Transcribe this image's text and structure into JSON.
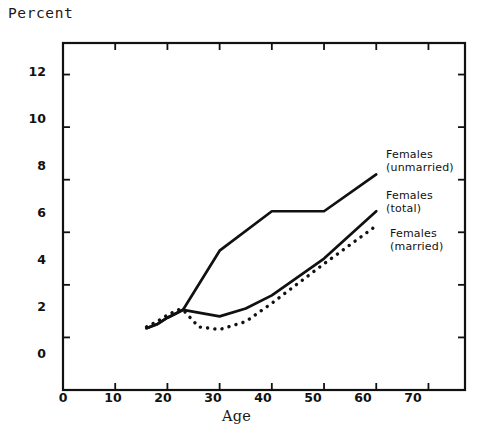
{
  "figure": {
    "y_axis_title": "Percent",
    "x_axis_title": "Age"
  },
  "chart_data": {
    "type": "line",
    "title": "",
    "xlabel": "Age",
    "ylabel": "Percent",
    "xlim": [
      0,
      77
    ],
    "ylim": [
      0,
      13.2
    ],
    "xticks": [
      0,
      10,
      20,
      30,
      40,
      50,
      60,
      70
    ],
    "yticks": [
      0,
      2,
      4,
      6,
      8,
      10,
      12
    ],
    "xtick_labels": [
      "0",
      "10",
      "20",
      "30",
      "40",
      "50",
      "60",
      "70"
    ],
    "ytick_labels": [
      "0",
      "2",
      "4",
      "6",
      "8",
      "10",
      "12"
    ],
    "grid": false,
    "legend_position": "inline-right",
    "series": [
      {
        "name": "Females (unmarried)",
        "label_line1": "Females",
        "label_line2": "(unmarried)",
        "style": "solid",
        "x": [
          16,
          18,
          20,
          22,
          23,
          30,
          40,
          50,
          60
        ],
        "values": [
          2.35,
          2.5,
          2.75,
          2.95,
          3.05,
          5.3,
          6.8,
          6.8,
          8.2
        ]
      },
      {
        "name": "Females (total)",
        "label_line1": "Females",
        "label_line2": "(total)",
        "style": "solid",
        "x": [
          16,
          18,
          20,
          22,
          23,
          30,
          35,
          40,
          50,
          60
        ],
        "values": [
          2.35,
          2.5,
          2.75,
          2.95,
          3.05,
          2.8,
          3.1,
          3.6,
          5.0,
          6.8
        ]
      },
      {
        "name": "Females (married)",
        "label_line1": "Females",
        "label_line2": "(married)",
        "style": "dotted",
        "x": [
          16,
          18,
          20,
          22,
          23,
          26,
          30,
          35,
          40,
          50,
          60
        ],
        "values": [
          2.4,
          2.6,
          2.85,
          3.05,
          3.05,
          2.4,
          2.3,
          2.6,
          3.3,
          4.8,
          6.25
        ]
      }
    ]
  },
  "colors": {
    "ink": "#111111",
    "background": "#ffffff"
  }
}
